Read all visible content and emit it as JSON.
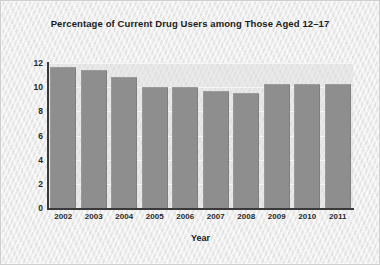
{
  "chart_data": {
    "type": "bar",
    "title": "Percentage of Current Drug Users among Those Aged 12–17",
    "xlabel": "Year",
    "ylabel": "",
    "categories": [
      "2002",
      "2003",
      "2004",
      "2005",
      "2006",
      "2007",
      "2008",
      "2009",
      "2010",
      "2011"
    ],
    "values": [
      11.6,
      11.3,
      10.8,
      9.9,
      9.9,
      9.6,
      9.4,
      10.2,
      10.2,
      10.2
    ],
    "ylim": [
      0,
      12
    ],
    "yticks": [
      0,
      2,
      4,
      6,
      8,
      10,
      12
    ],
    "ytick_labels": [
      "0",
      "2",
      "4",
      "6",
      "8",
      "10",
      "12"
    ],
    "grid": true,
    "grid_axis": "y",
    "legend": false,
    "legend_position": "none",
    "bar_color": "#8e8e8e",
    "plot_background": "#dedede",
    "figure_background": "#e9e9e9",
    "gridline_color": "#f5f5f5",
    "axis_color": "#3a3a3a",
    "text_color": "#1b1b1b"
  }
}
